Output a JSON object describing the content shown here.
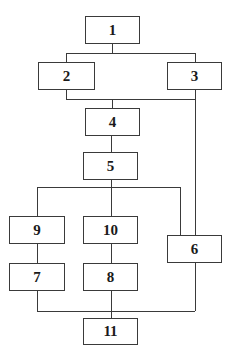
{
  "diagram": {
    "type": "block-flow",
    "nodes": [
      {
        "id": "1",
        "label": "1"
      },
      {
        "id": "2",
        "label": "2"
      },
      {
        "id": "3",
        "label": "3"
      },
      {
        "id": "4",
        "label": "4"
      },
      {
        "id": "5",
        "label": "5"
      },
      {
        "id": "6",
        "label": "6"
      },
      {
        "id": "7",
        "label": "7"
      },
      {
        "id": "8",
        "label": "8"
      },
      {
        "id": "9",
        "label": "9"
      },
      {
        "id": "10",
        "label": "10"
      },
      {
        "id": "11",
        "label": "11"
      }
    ],
    "edges": [
      [
        "1",
        "2"
      ],
      [
        "1",
        "3"
      ],
      [
        "2",
        "4"
      ],
      [
        "3",
        "4"
      ],
      [
        "3",
        "6"
      ],
      [
        "4",
        "5"
      ],
      [
        "5",
        "9"
      ],
      [
        "5",
        "10"
      ],
      [
        "5",
        "6"
      ],
      [
        "9",
        "7"
      ],
      [
        "10",
        "8"
      ],
      [
        "7",
        "11"
      ],
      [
        "8",
        "11"
      ],
      [
        "6",
        "11"
      ]
    ]
  }
}
